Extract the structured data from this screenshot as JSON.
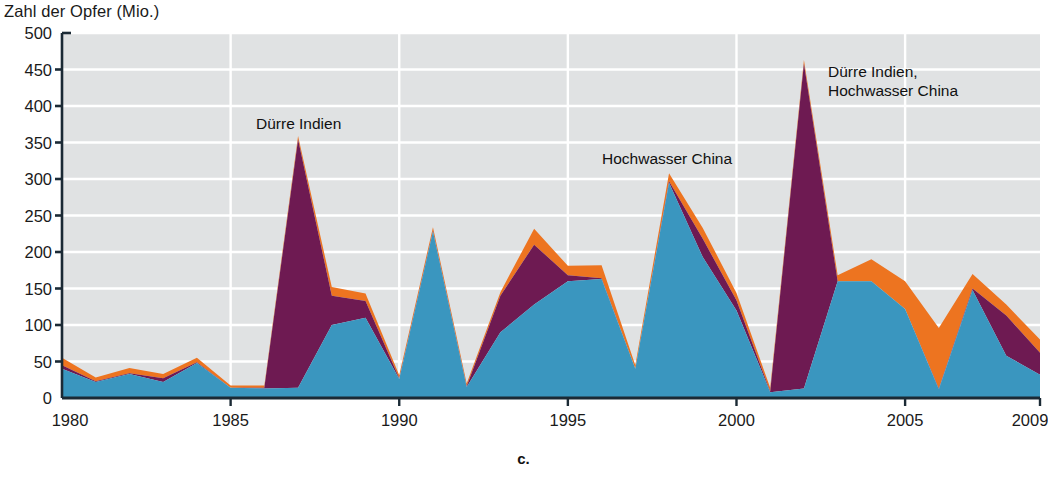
{
  "figure": {
    "caption": "c.",
    "y_axis_title": "Zahl der Opfer (Mio.)"
  },
  "colors": {
    "band_blue": "#3a96bf",
    "band_purple": "#6e1a52",
    "band_orange": "#ed7420",
    "plot_background": "#e0e2e3",
    "gridline": "#ffffff",
    "axis": "#1b2a35",
    "text": "#1a1a1a"
  },
  "annotations": [
    {
      "name": "annotation-duerre-indien-1987",
      "text": "Dürre Indien",
      "x": 256,
      "y": 114
    },
    {
      "name": "annotation-hochwasser-china-1998",
      "text": "Hochwasser China",
      "x": 602,
      "y": 149
    },
    {
      "name": "annotation-duerre-indien-hochwasser-china-2002",
      "text": "Dürre Indien,\nHochwasser China",
      "x": 828,
      "y": 62
    }
  ],
  "chart_data": {
    "type": "area",
    "title": "Zahl der Opfer (Mio.)",
    "xlabel": "",
    "ylabel": "Zahl der Opfer (Mio.)",
    "xlim": [
      1980,
      2009
    ],
    "ylim": [
      0,
      500
    ],
    "ytick_step": 50,
    "grid": true,
    "legend_position": "none",
    "stacked": true,
    "yticks": [
      0,
      50,
      100,
      150,
      200,
      250,
      300,
      350,
      400,
      450,
      500
    ],
    "xticks": [
      1980,
      1985,
      1990,
      1995,
      2000,
      2005,
      2009
    ],
    "x": [
      1980,
      1981,
      1982,
      1983,
      1984,
      1985,
      1986,
      1987,
      1988,
      1989,
      1990,
      1991,
      1992,
      1993,
      1994,
      1995,
      1996,
      1997,
      1998,
      1999,
      2000,
      2001,
      2002,
      2003,
      2004,
      2005,
      2006,
      2007,
      2008,
      2009
    ],
    "series": [
      {
        "name": "Blau (untere Schicht)",
        "color": "#3a96bf",
        "values": [
          40,
          22,
          33,
          22,
          48,
          14,
          13,
          14,
          100,
          110,
          26,
          228,
          15,
          90,
          128,
          160,
          163,
          40,
          295,
          193,
          120,
          8,
          13,
          160,
          160,
          122,
          12,
          148,
          58,
          32
        ]
      },
      {
        "name": "Violett (mittlere Schicht)",
        "color": "#6e1a52",
        "values": [
          5,
          1,
          1,
          5,
          1,
          0,
          1,
          340,
          40,
          23,
          1,
          1,
          1,
          50,
          82,
          8,
          1,
          0,
          2,
          25,
          14,
          1,
          445,
          0,
          0,
          0,
          1,
          2,
          55,
          30
        ]
      },
      {
        "name": "Orange (obere Schicht)",
        "color": "#ed7420",
        "values": [
          10,
          5,
          7,
          6,
          6,
          3,
          3,
          5,
          12,
          10,
          4,
          5,
          4,
          5,
          22,
          13,
          18,
          5,
          11,
          15,
          10,
          5,
          5,
          8,
          30,
          38,
          83,
          20,
          15,
          18
        ]
      }
    ],
    "totals": [
      55,
      28,
      41,
      33,
      55,
      17,
      17,
      359,
      152,
      143,
      31,
      234,
      20,
      145,
      232,
      181,
      182,
      45,
      308,
      233,
      144,
      14,
      463,
      168,
      190,
      160,
      96,
      170,
      128,
      80
    ]
  }
}
